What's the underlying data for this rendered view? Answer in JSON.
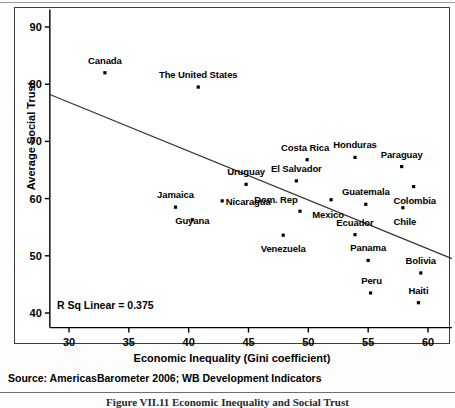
{
  "chart_data": {
    "type": "scatter",
    "title": "",
    "xlabel": "Economic Inequality (Gini coefficient)",
    "ylabel": "Average Social Trust",
    "xlim": [
      28.4,
      62.0
    ],
    "ylim": [
      38.5,
      92.0
    ],
    "xticks": [
      30,
      35,
      40,
      45,
      50,
      55,
      60
    ],
    "yticks": [
      40,
      50,
      60,
      70,
      80,
      90
    ],
    "grid": false,
    "legend": false,
    "annotation": "R Sq Linear = 0.375",
    "r_squared": 0.375,
    "fit_line": {
      "type": "linear",
      "x_start": 28.4,
      "y_start": 78.2,
      "x_end": 62.0,
      "y_end": 49.5
    },
    "points": [
      {
        "label": "Canada",
        "x": 33.0,
        "y": 82.0,
        "label_dx": 0,
        "label_dy": -13
      },
      {
        "label": "The United States",
        "x": 40.8,
        "y": 79.5,
        "label_dx": 0,
        "label_dy": -13
      },
      {
        "label": "Honduras",
        "x": 53.9,
        "y": 67.2,
        "label_dx": 0,
        "label_dy": -13
      },
      {
        "label": "Costa Rica",
        "x": 49.9,
        "y": 66.8,
        "label_dx": -2,
        "label_dy": -13
      },
      {
        "label": "Paraguay",
        "x": 57.8,
        "y": 65.6,
        "label_dx": 0,
        "label_dy": -13
      },
      {
        "label": "El Salvador",
        "x": 49.0,
        "y": 63.1,
        "label_dx": 0,
        "label_dy": -13
      },
      {
        "label": "Uruguay",
        "x": 44.8,
        "y": 62.5,
        "label_dx": 0,
        "label_dy": -13
      },
      {
        "label": "Colombia",
        "x": 58.8,
        "y": 62.1,
        "label_dx": 1,
        "label_dy": 13
      },
      {
        "label": "Jamaica",
        "x": 38.9,
        "y": 58.5,
        "label_dx": 0,
        "label_dy": -13
      },
      {
        "label": "Nicaragua",
        "x": 42.8,
        "y": 59.6,
        "label_dx": 26,
        "label_dy": 0
      },
      {
        "label": "Dom. Rep",
        "x": 49.3,
        "y": 57.8,
        "label_dx": -24,
        "label_dy": -12
      },
      {
        "label": "Guatemala",
        "x": 54.8,
        "y": 59.0,
        "label_dx": 0,
        "label_dy": -13
      },
      {
        "label": "Chile",
        "x": 57.9,
        "y": 58.4,
        "label_dx": 2,
        "label_dy": 13
      },
      {
        "label": "Mexico",
        "x": 51.9,
        "y": 59.8,
        "label_dx": -3,
        "label_dy": 14
      },
      {
        "label": "Guyana",
        "x": 40.3,
        "y": 56.3,
        "label_dx": 0,
        "label_dy": 0
      },
      {
        "label": "Ecuador",
        "x": 53.9,
        "y": 53.7,
        "label_dx": 0,
        "label_dy": -13
      },
      {
        "label": "Venezuela",
        "x": 47.9,
        "y": 53.6,
        "label_dx": 0,
        "label_dy": 13
      },
      {
        "label": "Panama",
        "x": 55.0,
        "y": 49.2,
        "label_dx": 0,
        "label_dy": -13
      },
      {
        "label": "Bolivia",
        "x": 59.4,
        "y": 47.0,
        "label_dx": 0,
        "label_dy": -13
      },
      {
        "label": "Peru",
        "x": 55.2,
        "y": 43.5,
        "label_dx": 1,
        "label_dy": -13
      },
      {
        "label": "Haiti",
        "x": 59.2,
        "y": 41.8,
        "label_dx": 0,
        "label_dy": -13
      }
    ]
  },
  "notes": {
    "source": "Source: AmericasBarometer 2006; WB Development Indicators",
    "caption": "Figure VII.11  Economic Inequality and Social Trust"
  },
  "colors": {
    "marker": "#000000",
    "axis": "#000000",
    "fit_line": "#333333",
    "background": "#ffffff"
  }
}
